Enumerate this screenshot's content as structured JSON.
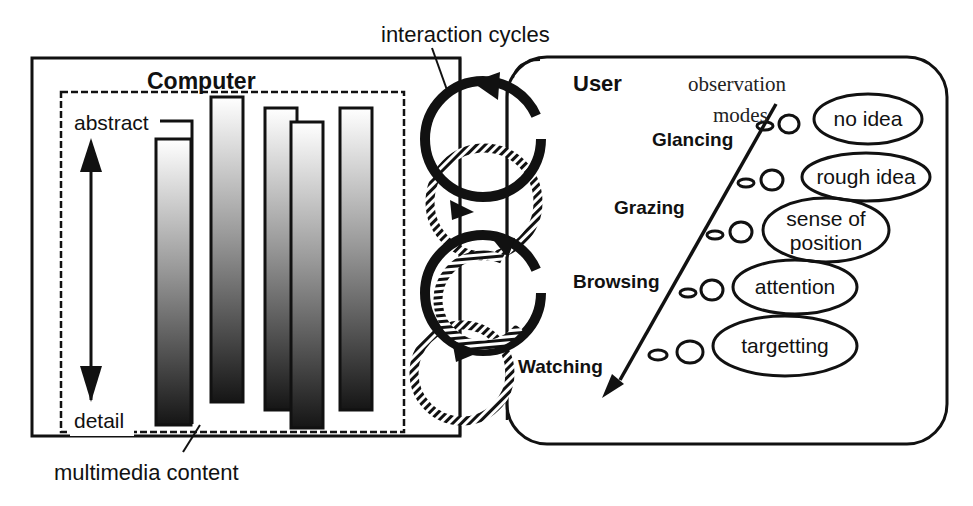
{
  "diagram": {
    "computer": {
      "title": "Computer",
      "content_label": "multimedia content",
      "axis_top_label": "abstract",
      "axis_bottom_label": "detail"
    },
    "interaction": {
      "label": "interaction cycles",
      "cycles": [
        {
          "style": "solid",
          "position": "upper"
        },
        {
          "style": "hatched",
          "position": "upper-middle"
        },
        {
          "style": "solid",
          "position": "lower-middle"
        },
        {
          "style": "hatched",
          "position": "lower"
        }
      ]
    },
    "user": {
      "title": "User",
      "modes_label_line1": "observation",
      "modes_label_line2": "modes",
      "modes": [
        {
          "name": "Glancing",
          "thought": "no idea"
        },
        {
          "name": "Grazing",
          "thought": "rough idea"
        },
        {
          "name": "Browsing",
          "thought": "sense of position"
        },
        {
          "name": "Watching",
          "thought": "attention"
        },
        {
          "name": "",
          "thought": "targetting"
        }
      ],
      "thoughts": {
        "t0": "no idea",
        "t1": "rough idea",
        "t2a": "sense of",
        "t2b": "position",
        "t3": "attention",
        "t4": "targetting"
      }
    }
  }
}
